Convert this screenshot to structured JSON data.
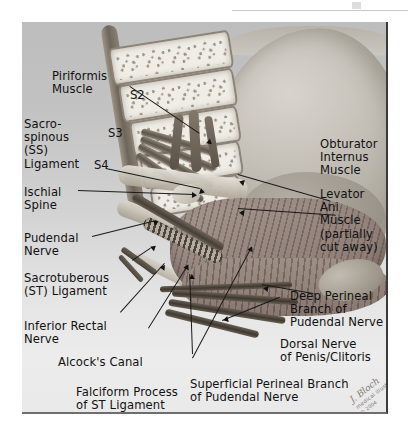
{
  "figure": {
    "kind": "anatomical-illustration",
    "panel_bg_top": "#bdbdbd",
    "panel_bg_bottom": "#ececec",
    "label_color": "#111111",
    "leader_color": "#1a1a1a"
  },
  "segments": [
    {
      "name": "s2",
      "text": "S2"
    },
    {
      "name": "s3",
      "text": "S3"
    },
    {
      "name": "s4",
      "text": "S4"
    }
  ],
  "labels": [
    {
      "name": "piriformis-muscle",
      "text": "Piriformis\nMuscle"
    },
    {
      "name": "sacrospinous-ligament",
      "text": "Sacro-\nspinous\n(SS)\nLigament"
    },
    {
      "name": "ischial-spine",
      "text": "Ischial\nSpine"
    },
    {
      "name": "pudendal-nerve",
      "text": "Pudendal\nNerve"
    },
    {
      "name": "sacrotuberous-ligament",
      "text": "Sacrotuberous\n(ST) Ligament"
    },
    {
      "name": "inferior-rectal-nerve",
      "text": "Inferior Rectal\nNerve"
    },
    {
      "name": "alcocks-canal",
      "text": "Alcock's Canal"
    },
    {
      "name": "falciform-process",
      "text": "Falciform Process\nof ST Ligament"
    },
    {
      "name": "obturator-internus-muscle",
      "text": "Obturator\nInternus\nMuscle"
    },
    {
      "name": "levator-ani-muscle",
      "text": "Levator Ani\nMuscle\n(partially\ncut away)"
    },
    {
      "name": "deep-perineal-branch",
      "text": "Deep Perineal\nBranch of\nPudendal Nerve"
    },
    {
      "name": "dorsal-nerve",
      "text": "Dorsal Nerve\nof Penis/Clitoris"
    },
    {
      "name": "superficial-perineal-branch",
      "text": "Superficial Perineal Branch\nof Pudendal Nerve"
    }
  ],
  "signature": {
    "name": "J. Bloch",
    "line2": "medical illustration",
    "line3": "© 2004"
  }
}
